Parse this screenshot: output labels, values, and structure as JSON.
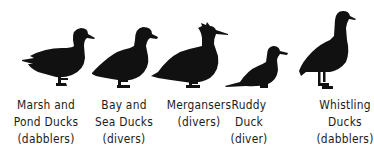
{
  "figure": {
    "silhouette_color": "#111111",
    "background_color": "#ffffff",
    "ducks": [
      {
        "name": "marsh-pond-ducks",
        "lines": [
          "Marsh and",
          "Pond Ducks",
          "(dabblers)"
        ],
        "center_x": 46
      },
      {
        "name": "bay-sea-ducks",
        "lines": [
          "Bay and",
          "Sea Ducks",
          "(divers)"
        ],
        "center_x": 124
      },
      {
        "name": "mergansers",
        "lines": [
          "Mergansers",
          "(divers)"
        ],
        "center_x": 199
      },
      {
        "name": "ruddy-duck",
        "lines": [
          "Ruddy",
          "Duck",
          "(diver)"
        ],
        "center_x": 249
      },
      {
        "name": "whistling-ducks",
        "lines": [
          "Whistling",
          "Ducks",
          "(dabblers)"
        ],
        "center_x": 345
      }
    ]
  }
}
